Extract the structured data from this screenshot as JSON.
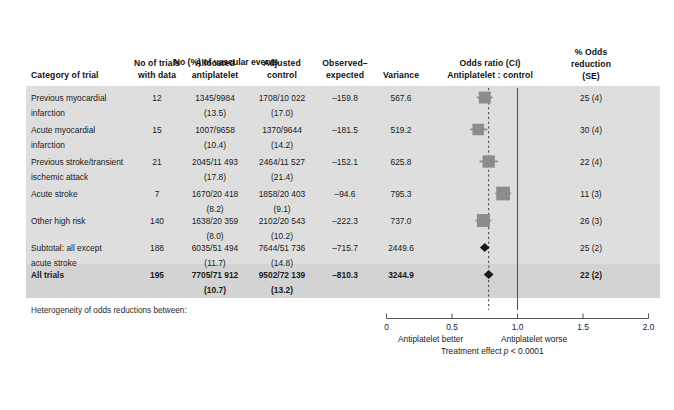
{
  "figure": {
    "headers": {
      "category": "Category of trial",
      "no_of_trials_line1": "No of trials",
      "no_of_trials_line2": "with data",
      "vascular_events_group": "No (%) of vascular events",
      "allocated_line1": "Allocated",
      "allocated_line2": "antiplatelet",
      "adjusted_line1": "Adjusted",
      "adjusted_line2": "control",
      "observed_line1": "Observed–",
      "observed_line2": "expected",
      "variance": "Variance",
      "odds_ratio_line1": "Odds ratio (CI)",
      "odds_ratio_line2": "Antiplatelet : control",
      "odds_reduction_line1": "% Odds",
      "odds_reduction_line2": "reduction",
      "odds_reduction_line3": "(SE)"
    },
    "rows": [
      {
        "category_line1": "Previous myocardial",
        "category_line2": "infarction",
        "no_of_trials": "12",
        "allocated": "1345/9984",
        "allocated_pct": "(13.5)",
        "adjusted": "1708/10 022",
        "adjusted_pct": "(17.0)",
        "observed_expected": "–159.8",
        "variance": "567.6",
        "odds_reduction": "25 (4)",
        "bold": false
      },
      {
        "category_line1": "Acute myocardial",
        "category_line2": "infarction",
        "no_of_trials": "15",
        "allocated": "1007/9658",
        "allocated_pct": "(10.4)",
        "adjusted": "1370/9644",
        "adjusted_pct": "(14.2)",
        "observed_expected": "–181.5",
        "variance": "519.2",
        "odds_reduction": "30 (4)",
        "bold": false
      },
      {
        "category_line1": "Previous stroke/transient",
        "category_line2": "ischemic attack",
        "no_of_trials": "21",
        "allocated": "2045/11 493",
        "allocated_pct": "(17.8)",
        "adjusted": "2464/11 527",
        "adjusted_pct": "(21.4)",
        "observed_expected": "–152.1",
        "variance": "625.8",
        "odds_reduction": "22 (4)",
        "bold": false
      },
      {
        "category_line1": "Acute stroke",
        "category_line2": "",
        "no_of_trials": "7",
        "allocated": "1670/20 418",
        "allocated_pct": "(8.2)",
        "adjusted": "1858/20 403",
        "adjusted_pct": "(9.1)",
        "observed_expected": "–94.6",
        "variance": "795.3",
        "odds_reduction": "11 (3)",
        "bold": false
      },
      {
        "category_line1": "Other high risk",
        "category_line2": "",
        "no_of_trials": "140",
        "allocated": "1638/20 359",
        "allocated_pct": "(8.0)",
        "adjusted": "2102/20 543",
        "adjusted_pct": "(10.2)",
        "observed_expected": "–222.3",
        "variance": "737.0",
        "odds_reduction": "26 (3)",
        "bold": false
      },
      {
        "category_line1": "Subtotal: all except",
        "category_line2": "acute stroke",
        "no_of_trials": "188",
        "allocated": "6035/51 494",
        "allocated_pct": "(11.7)",
        "adjusted": "7644/51 736",
        "adjusted_pct": "(14.8)",
        "observed_expected": "–715.7",
        "variance": "2449.6",
        "odds_reduction": "25 (2)",
        "bold": false
      },
      {
        "category_line1": "All trials",
        "category_line2": "",
        "no_of_trials": "195",
        "allocated": "7705/71 912",
        "allocated_pct": "(10.7)",
        "adjusted": "9502/72 139",
        "adjusted_pct": "(13.2)",
        "observed_expected": "–810.3",
        "variance": "3244.9",
        "odds_reduction": "22 (2)",
        "bold": true
      }
    ],
    "footnote": "Heterogeneity of odds reductions between:",
    "axis": {
      "ticks": [
        "0",
        "0.5",
        "1.0",
        "1.5",
        "2.0"
      ],
      "left_label": "Antiplatelet better",
      "right_label": "Antiplatelet worse",
      "treatment_effect_prefix": "Treatment effect ",
      "treatment_effect_p": "p",
      "treatment_effect_value": " < 0.0001"
    },
    "colors": {
      "band": "#dedede",
      "band_total": "#d3d3d3",
      "marker": "#8c8c8c",
      "diamond": "#1a1a1a",
      "axis": "#555555",
      "page": "#ffffff"
    }
  },
  "chart_data": {
    "type": "forest",
    "xlabel": "Odds ratio",
    "xlim": [
      0,
      2.0
    ],
    "xticks": [
      0,
      0.5,
      1.0,
      1.5,
      2.0
    ],
    "reference_line": 1.0,
    "pooled_dashed_line": 0.78,
    "grid": false,
    "categories": [
      "Previous myocardial infarction",
      "Acute myocardial infarction",
      "Previous stroke/transient ischemic attack",
      "Acute stroke",
      "Other high risk",
      "Subtotal: all except acute stroke",
      "All trials"
    ],
    "odds_ratio": [
      0.75,
      0.7,
      0.78,
      0.89,
      0.74,
      0.75,
      0.78
    ],
    "ci_low": [
      0.69,
      0.64,
      0.71,
      0.83,
      0.68,
      0.72,
      0.75
    ],
    "ci_high": [
      0.81,
      0.77,
      0.85,
      0.95,
      0.8,
      0.78,
      0.81
    ],
    "odds_reduction_pct": [
      25,
      30,
      22,
      11,
      26,
      25,
      22
    ],
    "odds_reduction_se": [
      4,
      4,
      4,
      3,
      3,
      2,
      2
    ],
    "observed_minus_expected": [
      -159.8,
      -181.5,
      -152.1,
      -94.6,
      -222.3,
      -715.7,
      -810.3
    ],
    "variance": [
      567.6,
      519.2,
      625.8,
      795.3,
      737.0,
      2449.6,
      3244.9
    ],
    "no_of_trials": [
      12,
      15,
      21,
      7,
      140,
      188,
      195
    ],
    "marker_shape": [
      "square",
      "square",
      "square",
      "square",
      "square",
      "diamond",
      "diamond"
    ],
    "marker_size_rel": [
      0.62,
      0.56,
      0.66,
      0.84,
      0.74,
      1.0,
      1.0
    ],
    "p_value": "< 0.0001"
  }
}
